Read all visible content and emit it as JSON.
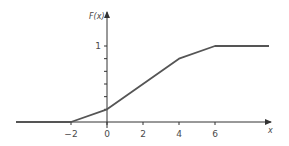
{
  "chart_data": {
    "type": "line",
    "title": "",
    "xlabel": "x",
    "ylabel": "F(x)",
    "x_ticks": [
      -2,
      0,
      2,
      4,
      6
    ],
    "x_tick_labels": [
      "−2",
      "0",
      "2",
      "4",
      "6"
    ],
    "y_ticks": [
      0.1667,
      0.3333,
      0.5,
      0.6667,
      0.8333,
      1
    ],
    "y_tick_labels": [
      "",
      "",
      "",
      "",
      "",
      "1"
    ],
    "xlim": [
      -7,
      9
    ],
    "ylim": [
      0,
      1.45
    ],
    "grid": false,
    "legend": null,
    "series": [
      {
        "name": "F(x)",
        "x": [
          -7,
          -2,
          0,
          4,
          6,
          9
        ],
        "y": [
          0,
          0,
          0.1667,
          0.8333,
          1,
          1
        ]
      }
    ],
    "colors": {
      "line": "#555555",
      "axis": "#333333",
      "text": "#4a4a4a"
    }
  }
}
